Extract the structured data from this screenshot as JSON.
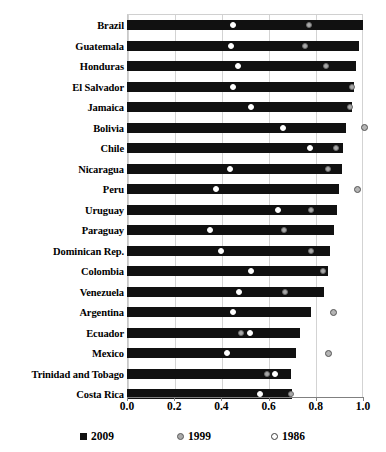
{
  "chart_data": {
    "type": "bar",
    "title": "",
    "subtitle": "",
    "xlabel": "",
    "ylabel": "",
    "xlim": [
      0.0,
      1.0
    ],
    "xticks": [
      "0.0",
      "0.2",
      "0.4",
      "0.6",
      "0.8",
      "1.0"
    ],
    "xtick_values": [
      0.0,
      0.2,
      0.4,
      0.6,
      0.8,
      1.0
    ],
    "grid": true,
    "orientation": "horizontal",
    "legend_position": "bottom",
    "legend": [
      {
        "label": "2009",
        "marker": "filled-square",
        "color": "#111111"
      },
      {
        "label": "1999",
        "marker": "gray-circle",
        "color": "#aaaaaa"
      },
      {
        "label": "1986",
        "marker": "open-circle",
        "color": "#ffffff"
      }
    ],
    "categories": [
      "Brazil",
      "Guatemala",
      "Honduras",
      "El Salvador",
      "Jamaica",
      "Bolivia",
      "Chile",
      "Nicaragua",
      "Peru",
      "Uruguay",
      "Paraguay",
      "Dominican Rep.",
      "Colombia",
      "Venezuela",
      "Argentina",
      "Ecuador",
      "Mexico",
      "Trinidad and Tobago",
      "Costa Rica"
    ],
    "series": [
      {
        "name": "2009",
        "type": "bar",
        "values": [
          1.0,
          0.985,
          0.97,
          0.96,
          0.955,
          0.93,
          0.915,
          0.91,
          0.9,
          0.89,
          0.875,
          0.86,
          0.85,
          0.835,
          0.78,
          0.735,
          0.715,
          0.695,
          0.7
        ]
      },
      {
        "name": "1999",
        "type": "marker",
        "values": [
          0.77,
          0.755,
          0.845,
          0.955,
          0.945,
          1.005,
          0.885,
          0.85,
          0.975,
          0.78,
          0.665,
          0.78,
          0.83,
          0.67,
          0.875,
          0.485,
          0.855,
          0.595,
          0.695
        ]
      },
      {
        "name": "1986",
        "type": "marker",
        "values": [
          0.45,
          0.44,
          0.47,
          0.45,
          0.525,
          0.66,
          0.775,
          0.435,
          0.375,
          0.64,
          0.35,
          0.4,
          0.525,
          0.475,
          0.45,
          0.52,
          0.425,
          0.625,
          0.565
        ]
      }
    ]
  }
}
